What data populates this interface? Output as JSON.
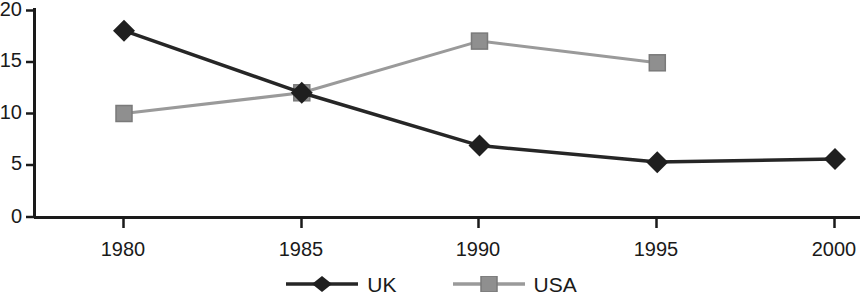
{
  "chart_data": {
    "type": "line",
    "title": "",
    "subtitle": "",
    "xlabel": "",
    "ylabel": "",
    "categories": [
      "1980",
      "1985",
      "1990",
      "1995",
      "2000"
    ],
    "x": [
      1980,
      1985,
      1990,
      1995,
      2000
    ],
    "series": [
      {
        "name": "UK",
        "color": "#262626",
        "marker": "diamond",
        "values": [
          18,
          12,
          6.9,
          5.3,
          5.6
        ]
      },
      {
        "name": "USA",
        "color": "#999999",
        "marker": "square",
        "values": [
          10,
          12,
          17,
          14.9,
          null
        ]
      }
    ],
    "xlim": [
      1980,
      2000
    ],
    "ylim": [
      0,
      20
    ],
    "y_ticks": [
      0,
      5,
      10,
      15,
      20
    ],
    "x_ticks": [
      "1980",
      "1985",
      "1990",
      "1995",
      "2000"
    ],
    "grid": false,
    "legend_position": "bottom-center",
    "legend_entries": [
      "UK",
      "USA"
    ],
    "annotations": []
  },
  "axes": {
    "y_tick_labels": [
      "20",
      "15",
      "10",
      "5",
      "0"
    ],
    "x_tick_labels": [
      "1980",
      "1985",
      "1990",
      "1995",
      "2000"
    ]
  },
  "legend": {
    "items": [
      {
        "label": "UK",
        "color": "#262626",
        "marker": "diamond"
      },
      {
        "label": "USA",
        "color": "#999999",
        "marker": "square"
      }
    ]
  },
  "colors": {
    "uk": "#262626",
    "usa": "#999999",
    "axis": "#1a1a1a",
    "background": "#ffffff"
  }
}
